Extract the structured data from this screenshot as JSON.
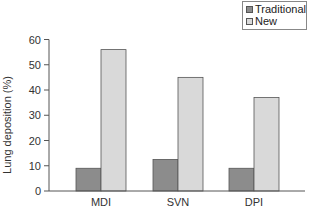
{
  "chart_data": {
    "type": "bar",
    "title": "",
    "xlabel": "",
    "ylabel": "Lung deposition (%)",
    "ylim": [
      0,
      60
    ],
    "yticks": [
      0,
      10,
      20,
      30,
      40,
      50,
      60
    ],
    "categories": [
      "MDI",
      "SVN",
      "DPI"
    ],
    "series": [
      {
        "name": "Traditional",
        "color": "#8c8c8c",
        "values": [
          9,
          12.5,
          9
        ]
      },
      {
        "name": "New",
        "color": "#d9d9d9",
        "values": [
          56,
          45,
          37
        ]
      }
    ],
    "grid": false,
    "legend_position": "top-right"
  },
  "legend": {
    "items": [
      {
        "label": "Traditional",
        "color": "#8c8c8c"
      },
      {
        "label": "New",
        "color": "#d9d9d9"
      }
    ]
  },
  "axis": {
    "ylabel": "Lung deposition (%)"
  }
}
